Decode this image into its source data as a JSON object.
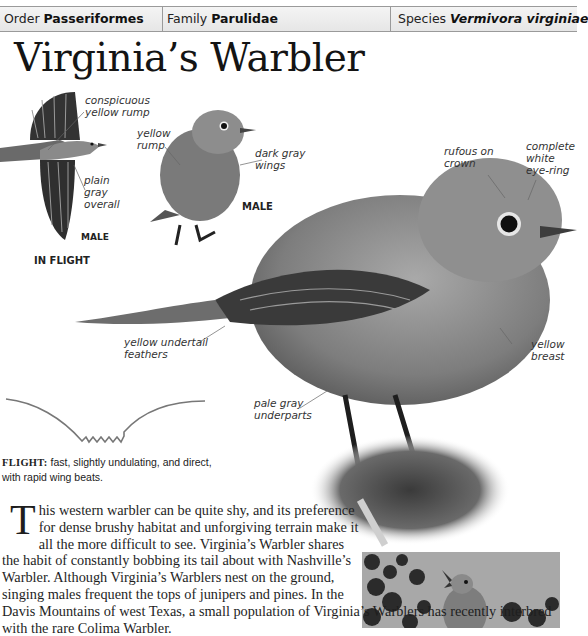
{
  "header": {
    "order_label": "Order",
    "order_value": "Passeriformes",
    "family_label": "Family",
    "family_value": "Parulidae",
    "species_label": "Species",
    "species_value": "Vermivora virginiae"
  },
  "title": "Virginia’s Warbler",
  "flight_illustration": {
    "labels": {
      "rump": [
        "conspicuous",
        "yellow rump"
      ],
      "overall": [
        "plain",
        "gray",
        "overall"
      ]
    },
    "sex": "MALE",
    "caption": "IN FLIGHT"
  },
  "perched_male": {
    "labels": {
      "rump": [
        "yellow",
        "rump"
      ],
      "wings": [
        "dark gray",
        "wings"
      ]
    },
    "sex": "MALE"
  },
  "main_bird": {
    "labels": {
      "crown": [
        "rufous on",
        "crown"
      ],
      "eye_ring": [
        "complete",
        "white",
        "eye-ring"
      ],
      "undertail": [
        "yellow undertail",
        "feathers"
      ],
      "breast": [
        "yellow",
        "breast"
      ],
      "underparts": [
        "pale gray",
        "underparts"
      ]
    }
  },
  "flight": {
    "key": "FLIGHT:",
    "line1": "fast, slightly undulating, and direct,",
    "line2": "with rapid wing beats."
  },
  "description": {
    "drop_cap": "T",
    "text": "his western warbler can be quite shy, and its preference for dense brushy habitat and unforgiving terrain make it all the more difficult to see. Virginia’s Warbler shares the habit of constantly bobbing its tail about with Nashville’s Warbler. Although Virginia’s Warblers nest on the ground, singing males frequent the tops of junipers and pines. In the Davis Mountains of west Texas, a small population of Virginia’s Warblers has recently interbred with the rare Colima Warbler."
  }
}
